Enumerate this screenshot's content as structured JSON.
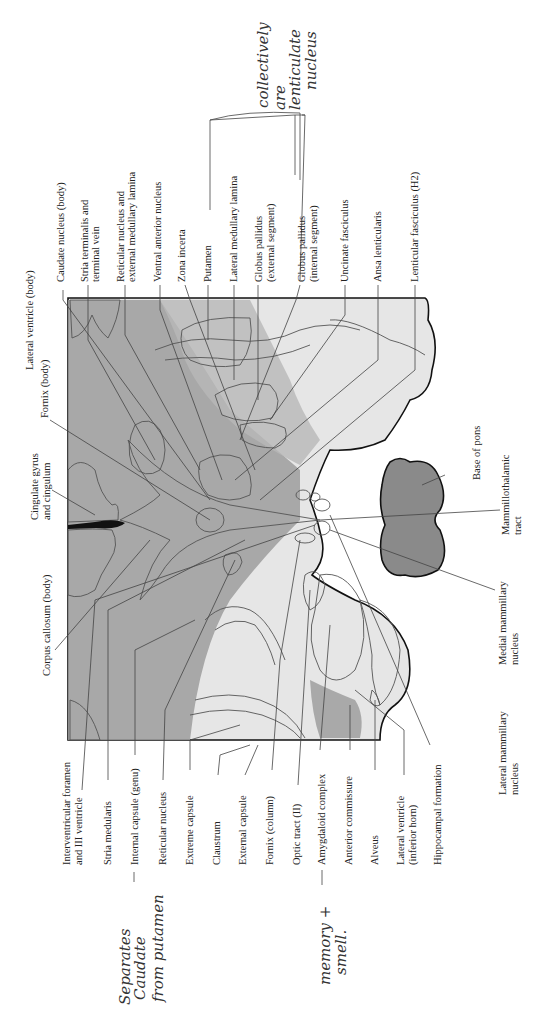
{
  "diagram": {
    "type": "anatomical-coronal-section",
    "colors": {
      "white_matter": "#e9e9e9",
      "gray_matter": "#9a9a9a",
      "dark_nuclei": "#7f7f7f",
      "ventricle": "#ffffff",
      "pons": "#8a8a8a",
      "outline": "#111111"
    }
  },
  "labels_top": [
    {
      "id": "lateral-ventricle-body",
      "text": "Lateral ventricle (body)"
    },
    {
      "id": "caudate-nucleus-body",
      "text": "Caudate nucleus (body)"
    },
    {
      "id": "stria-terminalis",
      "line1": "Stria terminalis and",
      "line2": "terminal vein"
    },
    {
      "id": "reticular-nucleus-lamina",
      "line1": "Reticular nucleus and",
      "line2": "external medullary lamina"
    },
    {
      "id": "ventral-anterior-nucleus",
      "text": "Ventral anterior nucleus"
    },
    {
      "id": "zona-incerta",
      "text": "Zona incerta"
    },
    {
      "id": "putamen",
      "text": "Putamen"
    },
    {
      "id": "lateral-medullary-lamina",
      "text": "Lateral medullary lamina"
    },
    {
      "id": "globus-pallidus-external",
      "line1": "Globus pallidus",
      "line2": "(external segment)"
    },
    {
      "id": "globus-pallidus-internal",
      "line1": "Globus pallidus",
      "line2": "(internal segment)"
    },
    {
      "id": "uncinate-fasciculus",
      "text": "Uncinate fasciculus"
    },
    {
      "id": "ansa-lenticularis",
      "text": "Ansa lenticularis"
    },
    {
      "id": "lenticular-fasciculus",
      "text": "Lenticular fasciculus (H2)"
    }
  ],
  "labels_left": [
    {
      "id": "fornix-body",
      "text": "Fornix (body)"
    },
    {
      "id": "cingulate-gyrus",
      "line1": "Cingulate gyrus",
      "line2": "and cingulum"
    },
    {
      "id": "corpus-callosum-body",
      "text": "Corpus callosum (body)"
    }
  ],
  "labels_bottom": [
    {
      "id": "interventricular-foramen",
      "line1": "Interventricular foramen",
      "line2": "and III ventricle"
    },
    {
      "id": "stria-medularis",
      "text": "Stria medularis"
    },
    {
      "id": "internal-capsule-genu",
      "text": "Internal capsule (genu)"
    },
    {
      "id": "reticular-nucleus",
      "text": "Reticular nucleus"
    },
    {
      "id": "extreme-capsule",
      "text": "Extreme capsule"
    },
    {
      "id": "claustrum",
      "text": "Claustrum"
    },
    {
      "id": "external-capsule",
      "text": "External capsule"
    },
    {
      "id": "fornix-column",
      "text": "Fornix (column)"
    },
    {
      "id": "optic-tract",
      "text": "Optic tract (II)"
    },
    {
      "id": "amygdaloid-complex",
      "text": "Amygdaloid complex"
    },
    {
      "id": "anterior-commissure",
      "text": "Anterior commissure"
    },
    {
      "id": "alveus",
      "text": "Alveus"
    },
    {
      "id": "lateral-ventricle-inferior",
      "line1": "Lateral ventricle",
      "line2": "(inferior horn)"
    },
    {
      "id": "hippocampal-formation",
      "text": "Hippocampal formation"
    },
    {
      "id": "lateral-mammillary",
      "line1": "Lateral mammillary",
      "line2": "nucleus"
    }
  ],
  "labels_right": [
    {
      "id": "base-of-pons",
      "text": "Base of pons"
    },
    {
      "id": "mammillothalamic-tract",
      "line1": "Mammillothalamic",
      "line2": "tract"
    },
    {
      "id": "medial-mammillary",
      "line1": "Medial mammillary",
      "line2": "nucleus"
    }
  ],
  "annotations": [
    {
      "id": "lenticular-note",
      "line1": "collectively",
      "line2": "are",
      "line3": "lenticulate",
      "line4": "nucleus"
    },
    {
      "id": "internal-capsule-note",
      "line1": "Separates",
      "line2": "Caudate",
      "line3": "from putamen"
    },
    {
      "id": "amygdala-note",
      "line1": "memory +",
      "line2": "smell."
    }
  ]
}
